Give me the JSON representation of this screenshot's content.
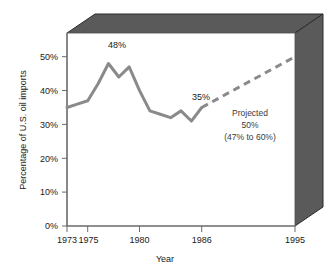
{
  "chart_data": {
    "type": "line",
    "title": "",
    "subtitle": "",
    "xlabel": "Year",
    "ylabel": "Percentage of U.S. oil imports",
    "xlim": [
      1973,
      1995
    ],
    "ylim": [
      0,
      57
    ],
    "grid": false,
    "legend_position": "none",
    "x_tick_labels": [
      "1973",
      "1975",
      "1980",
      "1986",
      "1995"
    ],
    "x_tick_values": [
      1973,
      1975,
      1980,
      1986,
      1995
    ],
    "y_tick_labels": [
      "0%",
      "10%",
      "20%",
      "30%",
      "40%",
      "50%"
    ],
    "y_tick_values": [
      0,
      10,
      20,
      30,
      40,
      50
    ],
    "series": [
      {
        "name": "Actual",
        "style": "solid",
        "color": "#8a8a8a",
        "x": [
          1973,
          1974,
          1975,
          1976,
          1977,
          1978,
          1979,
          1980,
          1981,
          1982,
          1983,
          1984,
          1985,
          1986
        ],
        "values": [
          35,
          36,
          37,
          42,
          48,
          44,
          47,
          40,
          34,
          33,
          32,
          34,
          31,
          35
        ]
      },
      {
        "name": "Projected",
        "style": "dashed",
        "color": "#8a8a8a",
        "x": [
          1986,
          1995
        ],
        "values": [
          35,
          50
        ]
      }
    ],
    "annotations": [
      {
        "id": "peak-label",
        "text": "48%",
        "x": 1977,
        "y": 48
      },
      {
        "id": "last-actual-label",
        "text": "35%",
        "x": 1986,
        "y": 35
      },
      {
        "id": "projected-line-1",
        "text": "Projected",
        "x": 1991,
        "y": 34
      },
      {
        "id": "projected-line-2",
        "text": "50%",
        "x": 1991,
        "y": 30
      },
      {
        "id": "projected-line-3",
        "text": "(47% to 60%)",
        "x": 1991,
        "y": 26
      }
    ],
    "colors": {
      "line": "#8a8a8a",
      "box_face_top": "#5a5a5a",
      "box_face_right": "#5a5a5a",
      "box_edge": "#2b2b2b",
      "plot_background": "#ffffff",
      "axis": "#6b6b6b",
      "text": "#1a1a1a"
    },
    "decoration": {
      "style": "3d-box",
      "description": "Plot drawn inside an open 3D box with shaded top and right faces"
    }
  }
}
